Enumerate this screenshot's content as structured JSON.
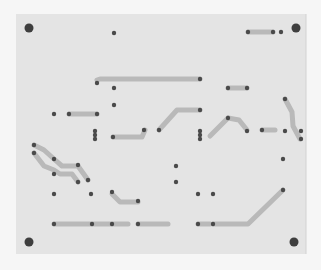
{
  "colors": {
    "background": "#f6f6f6",
    "board": "#e4e4e4",
    "trace": "#b9b9b9",
    "pad": "#4a4a4a",
    "mounting_hole": "#3e3e3e"
  },
  "board": {
    "mounting_holes": [
      {
        "id": "hole-top-left"
      },
      {
        "id": "hole-top-right"
      },
      {
        "id": "hole-bottom-left"
      },
      {
        "id": "hole-bottom-right"
      }
    ],
    "pad_count": 56,
    "trace_count": 17
  }
}
